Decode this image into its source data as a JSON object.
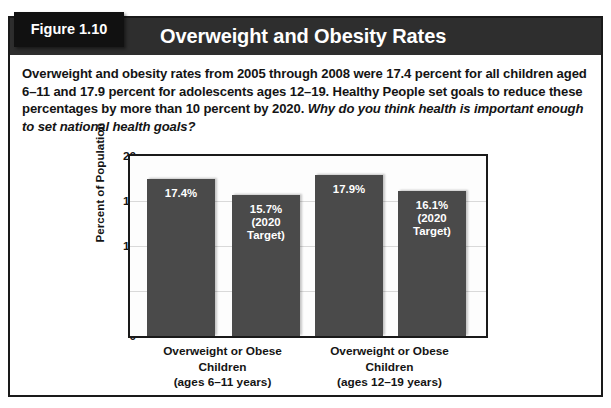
{
  "figure": {
    "tab_label": "Figure 1.10",
    "title": "Overweight and Obesity Rates",
    "caption_main": "Overweight and obesity rates from 2005 through 2008 were 17.4 percent for all children aged 6–11 and 17.9 percent for adolescents ages 12–19. Healthy People set goals to reduce these percentages by more than 10 percent by 2020. ",
    "caption_question": "Why do you think health is important enough to set national health goals?"
  },
  "colors": {
    "header_bar": "#2e2e2e",
    "tab": "#111111",
    "bar_fill": "#4a4a4a",
    "frame_border": "#1a1a1a",
    "gridline": "#d9d9d9",
    "bar_label_text": "#ffffff"
  },
  "chart_data": {
    "type": "bar",
    "title": "Overweight and Obesity Rates",
    "xlabel": "",
    "ylabel": "Percent of Population",
    "ylim": [
      0,
      20
    ],
    "yticks": [
      0,
      5,
      10,
      15,
      20
    ],
    "ytick_labels": [
      "0",
      "5",
      "10",
      "15",
      "20"
    ],
    "grid": true,
    "legend": "none",
    "categories": [
      "Overweight or Obese\nChildren\n(ages 6–11 years)",
      "Overweight or Obese\nChildren\n(ages 12–19 years)"
    ],
    "bars": [
      {
        "group": 0,
        "value": 17.4,
        "label": "17.4%",
        "series": "Current (2005–2008)"
      },
      {
        "group": 0,
        "value": 15.7,
        "label": "15.7%\n(2020\nTarget)",
        "series": "2020 Target"
      },
      {
        "group": 1,
        "value": 17.9,
        "label": "17.9%",
        "series": "Current (2005–2008)"
      },
      {
        "group": 1,
        "value": 16.1,
        "label": "16.1%\n(2020\nTarget)",
        "series": "2020 Target"
      }
    ]
  }
}
